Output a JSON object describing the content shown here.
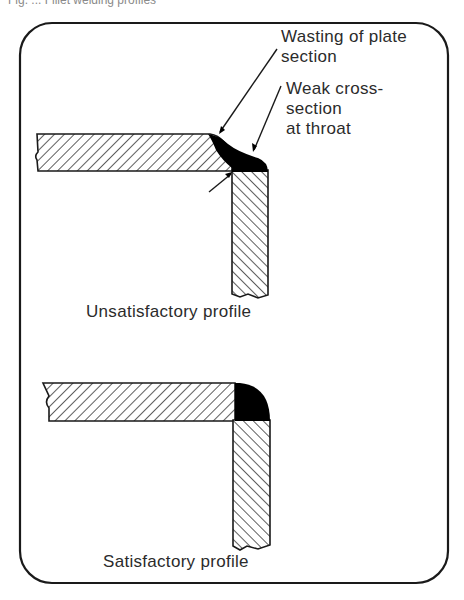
{
  "figure": {
    "caption_partial": "Fig. ... Fillet welding profiles",
    "annotations": {
      "wasting_line1": "Wasting of plate",
      "wasting_line2": "section",
      "weak_line1": "Weak cross-",
      "weak_line2": "section",
      "weak_line3": "at throat"
    },
    "panels": [
      {
        "label": "Unsatisfactory profile"
      },
      {
        "label": "Satisfactory profile"
      }
    ],
    "colors": {
      "ink": "#1a1a1a",
      "paper": "#ffffff",
      "weld": "#000000"
    }
  }
}
